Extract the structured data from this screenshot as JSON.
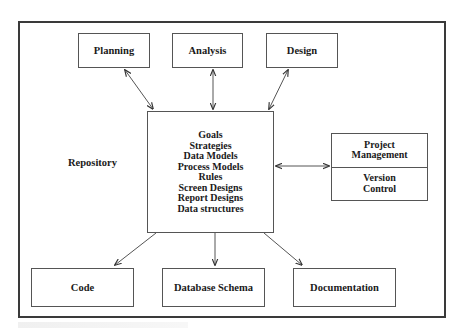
{
  "diagram": {
    "repository_label": "Repository",
    "top_boxes": [
      {
        "id": "planning",
        "label": "Planning"
      },
      {
        "id": "analysis",
        "label": "Analysis"
      },
      {
        "id": "design",
        "label": "Design"
      }
    ],
    "central_box": {
      "items": [
        "Goals",
        "Strategies",
        "Data Models",
        "Process Models",
        "Rules",
        "Screen Designs",
        "Report Designs",
        "Data structures"
      ]
    },
    "side_box": {
      "top": "Project Management",
      "top_lines": [
        "Project",
        "Management"
      ],
      "bottom": "Version Control",
      "bottom_lines": [
        "Version",
        "Control"
      ]
    },
    "bottom_boxes": [
      {
        "id": "code",
        "label": "Code"
      },
      {
        "id": "database-schema",
        "label": "Database Schema"
      },
      {
        "id": "documentation",
        "label": "Documentation"
      }
    ],
    "edges": [
      {
        "from": "planning",
        "to": "central",
        "type": "bidirectional"
      },
      {
        "from": "analysis",
        "to": "central",
        "type": "bidirectional"
      },
      {
        "from": "design",
        "to": "central",
        "type": "bidirectional"
      },
      {
        "from": "central",
        "to": "side_box",
        "type": "bidirectional"
      },
      {
        "from": "central",
        "to": "code",
        "type": "directed"
      },
      {
        "from": "central",
        "to": "database-schema",
        "type": "directed"
      },
      {
        "from": "central",
        "to": "documentation",
        "type": "directed"
      }
    ],
    "colors": {
      "line": "#555555",
      "frame": "#3a3a3a",
      "text": "#1a1a1a",
      "background": "#ffffff"
    }
  }
}
